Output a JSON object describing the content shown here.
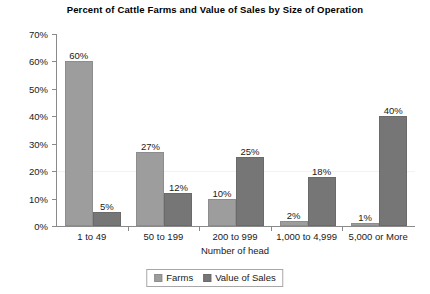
{
  "chart_data": {
    "type": "bar",
    "title": "Percent of Cattle Farms and Value of Sales by Size of Operation",
    "xlabel": "Number of head",
    "ylabel": "",
    "categories": [
      "1 to 49",
      "50 to 199",
      "200 to 999",
      "1,000 to 4,999",
      "5,000 or More"
    ],
    "series": [
      {
        "name": "Farms",
        "color": "#9d9d9d",
        "values": [
          60,
          27,
          10,
          2,
          1
        ],
        "labels": [
          "60%",
          "27%",
          "10%",
          "2%",
          "1%"
        ]
      },
      {
        "name": "Value of Sales",
        "color": "#767676",
        "values": [
          5,
          12,
          25,
          18,
          40
        ],
        "labels": [
          "5%",
          "12%",
          "25%",
          "18%",
          "40%"
        ]
      }
    ],
    "ylim": [
      0,
      70
    ],
    "ytick_values": [
      70,
      60,
      50,
      40,
      30,
      20,
      10,
      0
    ],
    "ytick_labels": [
      "70%",
      "60%",
      "50%",
      "40%",
      "30%",
      "20%",
      "10%",
      "0%"
    ],
    "grid": true,
    "gridlines_at": [
      20
    ],
    "legend_position": "bottom-center"
  }
}
